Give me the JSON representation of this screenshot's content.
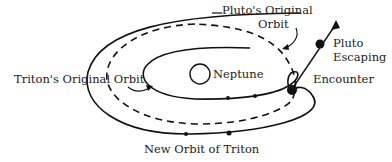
{
  "diagram": {
    "labels": {
      "pluto_original_orbit_line1": "Pluto's Original",
      "pluto_original_orbit_line2": "Orbit",
      "tritons_original_orbit": "Triton's Original Orbit",
      "neptune": "Neptune",
      "encounter": "Encounter",
      "pluto_escaping_line1": "Pluto",
      "pluto_escaping_line2": "Escaping",
      "new_orbit_of_triton": "New Orbit of Triton"
    },
    "colors": {
      "line": "#111111",
      "text": "#222222",
      "background": "#ffffff"
    }
  }
}
